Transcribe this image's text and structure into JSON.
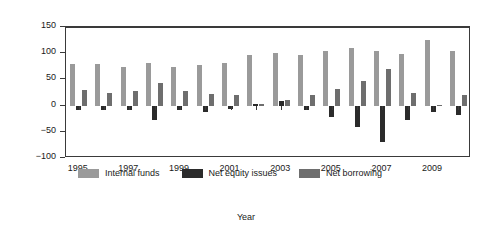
{
  "chart_data": {
    "type": "bar",
    "title": "",
    "xlabel": "Year",
    "ylabel": "Total sources, %",
    "ylim": [
      -100,
      150
    ],
    "yticks": [
      150,
      100,
      50,
      0,
      -50,
      -100
    ],
    "ytick_labels": [
      "150",
      "100",
      "50",
      "0",
      "−50",
      "−100"
    ],
    "grid": false,
    "legend_position": "inside-bottom-left",
    "categories": [
      1995,
      1996,
      1997,
      1998,
      1999,
      2000,
      2001,
      2002,
      2003,
      2004,
      2005,
      2006,
      2007,
      2008,
      2009,
      2010
    ],
    "xtick_labels": [
      "1995",
      "1997",
      "1999",
      "2001",
      "2003",
      "2005",
      "2007",
      "2009"
    ],
    "xtick_years": [
      1995,
      1997,
      1999,
      2001,
      2003,
      2005,
      2007,
      2009
    ],
    "series": [
      {
        "name": "Internal funds",
        "color": "#9a9a9a",
        "values": [
          79,
          80,
          74,
          81,
          74,
          77,
          82,
          97,
          100,
          96,
          104,
          109,
          104,
          99,
          125,
          104
        ]
      },
      {
        "name": "Net equity issues",
        "color": "#2b2b2b",
        "values": [
          -8,
          -8,
          -8,
          -27,
          -9,
          -12,
          -6,
          3,
          9,
          -8,
          -21,
          -40,
          -70,
          -27,
          -13,
          -18
        ]
      },
      {
        "name": "Net borrowing",
        "color": "#6e6e6e",
        "values": [
          29,
          24,
          27,
          44,
          28,
          23,
          21,
          3,
          10,
          20,
          31,
          47,
          70,
          24,
          2,
          21
        ]
      }
    ]
  }
}
